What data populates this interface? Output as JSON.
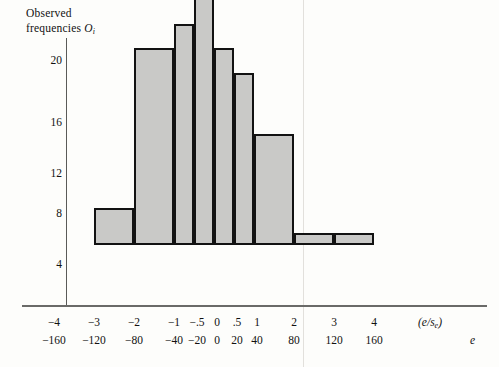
{
  "chart_data": {
    "type": "bar",
    "title": "Observed frequencies Oi",
    "title_line1": "Observed",
    "title_line2_prefix": "frequencies ",
    "title_line2_symbol": "O",
    "title_line2_subscript": "i",
    "ylabel": "Observed frequencies Oi",
    "xlabel_primary": "(e/se)",
    "xlabel_secondary": "e",
    "xlabel_primary_num": "(e/s",
    "xlabel_primary_sub": "e",
    "xlabel_primary_tail": ")",
    "grid": false,
    "legend": null,
    "ylim": [
      0,
      22.5
    ],
    "yticks": [
      4,
      8,
      12,
      16,
      20
    ],
    "ytick_labels": [
      "4",
      "8",
      "12",
      "16",
      "20"
    ],
    "xtick_labels_standardized": [
      "−4",
      "−3",
      "−2",
      "−1",
      "−.5",
      "0",
      ".5",
      "1",
      "2",
      "3",
      "4"
    ],
    "xtick_labels_raw": [
      "−160",
      "−120",
      "−80",
      "−40",
      "−20",
      "0",
      "20",
      "40",
      "80",
      "120",
      "160"
    ],
    "bin_edges_standardized": [
      "−4",
      "−3",
      "−2",
      "−1",
      "−.5",
      "0",
      ".5",
      "1",
      "2",
      "3",
      "4"
    ],
    "bin_edges_raw": [
      "−160",
      "−120",
      "−80",
      "−40",
      "−20",
      "0",
      "20",
      "40",
      "80",
      "120",
      "160"
    ],
    "categories": [
      "−3 to −2",
      "−2 to −1",
      "−1 to −.5",
      "−.5 to 0",
      "0 to .5",
      ".5 to 1",
      "1 to 2",
      "2 to 3",
      "3 to 4"
    ],
    "values": [
      3,
      16,
      18,
      21,
      16,
      14,
      9,
      1,
      1
    ],
    "bar_fill": "#c9c9c7",
    "bar_edge": "#121212",
    "axis_color": "#6a6a68",
    "background": "#fdfdfb"
  },
  "bars": [
    {
      "label": "−3 to −2",
      "value": 3,
      "left": 94,
      "width": 40
    },
    {
      "label": "−2 to −1",
      "value": 16,
      "left": 134,
      "width": 40
    },
    {
      "label": "−1 to −.5",
      "value": 18,
      "left": 174,
      "width": 20
    },
    {
      "label": "−.5 to 0",
      "value": 21,
      "left": 194,
      "width": 20
    },
    {
      "label": "0 to .5",
      "value": 16,
      "left": 214,
      "width": 20
    },
    {
      "label": ".5 to 1",
      "value": 14,
      "left": 234,
      "width": 20
    },
    {
      "label": "1 to 2",
      "value": 9,
      "left": 254,
      "width": 40
    },
    {
      "label": "2 to 3",
      "value": 1,
      "left": 294,
      "width": 40
    },
    {
      "label": "3 to 4",
      "value": 1,
      "left": 334,
      "width": 40
    }
  ],
  "yticks": [
    {
      "label": "20",
      "value": 20,
      "top": 54
    },
    {
      "label": "16",
      "value": 16,
      "top": 116
    },
    {
      "label": "12",
      "value": 12,
      "top": 167
    },
    {
      "label": "8",
      "value": 8,
      "top": 207
    },
    {
      "label": "4",
      "value": 4,
      "top": 258
    }
  ],
  "xticks": [
    {
      "primary": "−4",
      "secondary": "−160",
      "x": 54
    },
    {
      "primary": "−3",
      "secondary": "−120",
      "x": 94
    },
    {
      "primary": "−2",
      "secondary": "−80",
      "x": 134
    },
    {
      "primary": "−1",
      "secondary": "−40",
      "x": 174
    },
    {
      "primary": "−.5",
      "secondary": "−20",
      "x": 197
    },
    {
      "primary": "0",
      "secondary": "0",
      "x": 217
    },
    {
      "primary": ".5",
      "secondary": "20",
      "x": 237
    },
    {
      "primary": "1",
      "secondary": "40",
      "x": 257
    },
    {
      "primary": "2",
      "secondary": "80",
      "x": 294
    },
    {
      "primary": "3",
      "secondary": "120",
      "x": 334
    },
    {
      "primary": "4",
      "secondary": "160",
      "x": 374
    }
  ]
}
